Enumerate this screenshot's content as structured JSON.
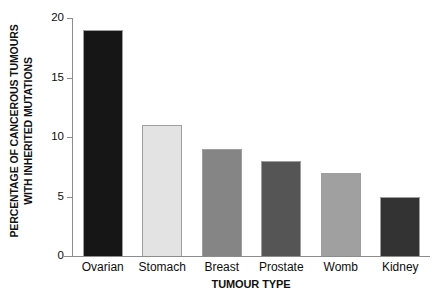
{
  "chart_data": {
    "type": "bar",
    "title": "",
    "categories": [
      "Ovarian",
      "Stomach",
      "Breast",
      "Prostate",
      "Womb",
      "Kidney"
    ],
    "values": [
      19,
      11,
      9,
      8,
      7,
      5
    ],
    "series": [
      {
        "name": "Percentage of cancerous tumours with inherited mutations",
        "values": [
          19,
          11,
          9,
          8,
          7,
          5
        ]
      }
    ],
    "bar_colors": [
      "#161616",
      "#e3e3e3",
      "#858585",
      "#555555",
      "#a0a0a0",
      "#333333"
    ],
    "xlabel": "TUMOUR TYPE",
    "ylabel_lines": [
      "PERCENTAGE OF CANCEROUS TUMOURS",
      "WITH INHERITED MUTATIONS"
    ],
    "ylabel": "PERCENTAGE OF CANCEROUS TUMOURS WITH INHERITED MUTATIONS",
    "yticks": [
      0,
      5,
      10,
      15,
      20
    ],
    "ytick_labels": [
      "0",
      "5",
      "10",
      "15",
      "20"
    ],
    "ylim": [
      0,
      20
    ],
    "grid": false,
    "legend": "none",
    "axis_color": "#8c8c8c",
    "background": "#ffffff"
  }
}
